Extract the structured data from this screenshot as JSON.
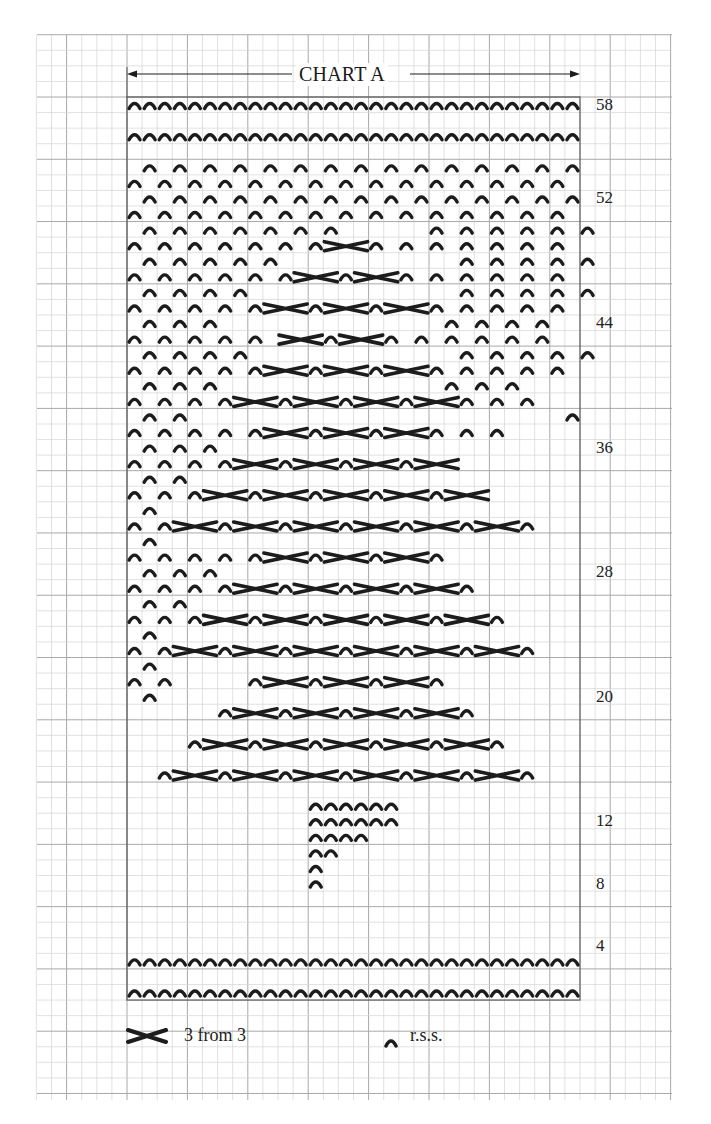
{
  "chart": {
    "title": "CHART A",
    "columns": 30,
    "rows": 58,
    "cell_width": 15.1,
    "cell_height": 15.57,
    "origin_x": 127,
    "origin_y": 97,
    "row_labels": [
      {
        "row": 58,
        "text": "58"
      },
      {
        "row": 52,
        "text": "52"
      },
      {
        "row": 44,
        "text": "44"
      },
      {
        "row": 36,
        "text": "36"
      },
      {
        "row": 28,
        "text": "28"
      },
      {
        "row": 20,
        "text": "20"
      },
      {
        "row": 12,
        "text": "12"
      },
      {
        "row": 8,
        "text": "8"
      },
      {
        "row": 4,
        "text": "4"
      }
    ],
    "pattern_rows_top_to_bottom": [
      "^^^^^^^^^^^^^^^^^^^^^^^^^^^^^^",
      "..............................",
      "^^^^^^^^^^^^^^^^^^^^^^^^^^^^^^",
      "..............................",
      ".^.^.^.^.^.^.^.^.^.^.^.^.^.^.^",
      "^.^.^.^.^.^.^.^.^.^.^.^.^.^.^.",
      ".^.^.^.^.^.^.^.^.^.^.^.^.^.^.^",
      "^.^.^.^.^.^.^.^.^.^.^.^.^.^.^.",
      ".^.^.^.^.^.^.^......^.^.^.^.^.^",
      "^.^.^.^.^.^.^X--^.^.^.^.^.^.^.",
      ".^.^.^.^.^............^.^.^.^.^",
      "^.^.^.^.^.^X--^X--^.^.^.^.^.^.",
      ".^.^.^.^..............^.^.^.^.^",
      "^.^.^.^.^X--^X--^X--^.^.^.^.^.",
      ".^.^.^...............^.^.^.^.",
      "^.^.^.^.^.X--^X--^.^.^.^.^.^.",
      ".^.^.^.^..............^.^.^.^.^",
      "^.^.^.^.^X--^X--^X--^.^.^.^.^.",
      ".^.^.^...............^.^.^...",
      "^.^.^.^X--^X--^X--^X--^.^.^..",
      ".^.^.........................^",
      "^.^.^.^.^X--^X--^X--^.^.^....",
      ".^.^.^.......................",
      "^.^.^.^X--^X--^X--^X--.......",
      ".^.^.........................",
      "^.^.^X--^X--^X--^X--^X--.....",
      ".^...........................",
      "^.^X--^X--^X--^X--^X--^X--^..",
      ".^...........................",
      "^.^.^.^.^X--^X--^X--^........",
      ".^.^.^.......................",
      "^.^.^.^X--^X--^X--^X--^......",
      ".^.^.........................",
      "^.^.^X--^X--^X--^X--^X--^....",
      ".^...........................",
      "^.^X--^X--^X--^X--^X--^X--^..",
      ".^...........................",
      "^.^.....^X--^X--^X--^........",
      ".^...........................",
      "......^X--^X--^X--^X--^......",
      "..............................",
      "....^X--^X--^X--^X--^X--^....",
      "..............................",
      "..^X--^X--^X--^X--^X--^X--^..",
      "..............................",
      "............^^^^^^............",
      "............^^^^^^............",
      "............^^^^..............",
      "............^^................",
      "............^.................",
      "............^.................",
      "..............................",
      "..............................",
      "..............................",
      "..............................",
      "^^^^^^^^^^^^^^^^^^^^^^^^^^^^^^",
      "..............................",
      "^^^^^^^^^^^^^^^^^^^^^^^^^^^^^^"
    ]
  },
  "legend": {
    "cross": {
      "symbol": "cross-3-from-3-icon",
      "label": "3 from 3"
    },
    "stitch": {
      "symbol": "rss-stitch-icon",
      "label": "r.s.s."
    }
  },
  "colors": {
    "ink": "#1c1c1c",
    "grid_minor": "#d4d4d4",
    "grid_major": "#a8a8a8",
    "border": "#555555",
    "paper": "#ffffff"
  }
}
